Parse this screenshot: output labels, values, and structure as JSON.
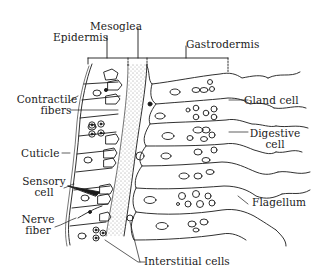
{
  "diagram": {
    "top_labels": {
      "mesoglea": "Mesoglea",
      "epidermis": "Epidermis",
      "gastrodermis": "Gastrodermis"
    },
    "left_labels": {
      "contractile_fibers_1": "Contractile",
      "contractile_fibers_2": "fibers",
      "cuticle": "Cuticle",
      "sensory_cell_1": "Sensory",
      "sensory_cell_2": "cell",
      "nerve_fiber_1": "Nerve",
      "nerve_fiber_2": "fiber"
    },
    "right_labels": {
      "gland_cell": "Gland cell",
      "digestive_cell_1": "Digestive",
      "digestive_cell_2": "cell",
      "flagellum": "Flagellum"
    },
    "bottom_labels": {
      "interstitial_cells": "Interstitial cells"
    },
    "colors": {
      "ink": "#1a1a1a",
      "background": "#ffffff"
    }
  }
}
